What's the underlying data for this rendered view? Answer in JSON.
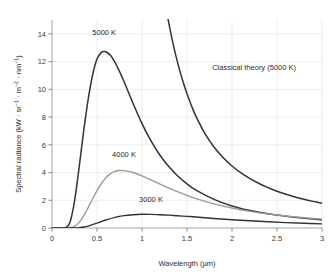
{
  "chart_data": {
    "type": "line",
    "title": "",
    "xlabel": "Wavelength (µm)",
    "ylabel_parts": {
      "base": "Spectral radiance (kW · sr",
      "sup1": "−1",
      "mid1": " · m",
      "sup2": "−2",
      "mid2": " · nm",
      "sup3": "−1",
      "close": ")"
    },
    "ylabel": "Spectral radiance (kW · sr−1 · m−2 · nm−1)",
    "xlim": [
      0,
      3
    ],
    "ylim": [
      0,
      15
    ],
    "xticks": [
      0,
      0.5,
      1,
      1.5,
      2,
      2.5,
      3
    ],
    "xticklabels": [
      "0",
      "0.5",
      "1",
      "1.5",
      "2",
      "2.5",
      "3"
    ],
    "yticks": [
      0,
      2,
      4,
      6,
      8,
      10,
      12,
      14
    ],
    "yticklabels": [
      "0",
      "2",
      "4",
      "6",
      "8",
      "10",
      "12",
      "14"
    ],
    "grid": true,
    "legend": "none",
    "annotations": [
      {
        "text": "5000 K",
        "x": 0.58,
        "y": 13.9,
        "name": "label-5000k"
      },
      {
        "text": "4000 K",
        "x": 0.8,
        "y": 5.1,
        "name": "label-4000k"
      },
      {
        "text": "3000 K",
        "x": 1.1,
        "y": 1.85,
        "name": "label-3000k"
      },
      {
        "text": "Classical theory (5000 K)",
        "x": 1.78,
        "y": 11.4,
        "name": "label-classical-theory"
      }
    ],
    "series": [
      {
        "name": "5000 K",
        "color": "#333333",
        "width": 1.5,
        "peak": {
          "x": 0.58,
          "y": 12.7
        },
        "x": [
          0.0,
          0.1,
          0.15,
          0.2,
          0.25,
          0.3,
          0.35,
          0.4,
          0.45,
          0.5,
          0.55,
          0.58,
          0.6,
          0.65,
          0.7,
          0.75,
          0.8,
          0.9,
          1.0,
          1.1,
          1.2,
          1.3,
          1.4,
          1.5,
          1.6,
          1.8,
          2.0,
          2.2,
          2.4,
          2.6,
          2.8,
          3.0
        ],
        "y": [
          0.0,
          0.0,
          0.03,
          0.42,
          1.92,
          4.3,
          6.9,
          9.21,
          11.0,
          12.19,
          12.67,
          12.72,
          12.7,
          12.45,
          11.95,
          11.3,
          10.56,
          9.0,
          7.53,
          6.28,
          5.25,
          4.41,
          3.73,
          3.18,
          2.73,
          2.06,
          1.59,
          1.26,
          1.02,
          0.84,
          0.7,
          0.59
        ]
      },
      {
        "name": "4000 K",
        "color": "#9a9a9a",
        "width": 1.4,
        "peak": {
          "x": 0.74,
          "y": 4.15
        },
        "x": [
          0.0,
          0.15,
          0.2,
          0.25,
          0.3,
          0.35,
          0.4,
          0.45,
          0.5,
          0.55,
          0.6,
          0.65,
          0.7,
          0.74,
          0.8,
          0.9,
          1.0,
          1.1,
          1.2,
          1.3,
          1.4,
          1.5,
          1.6,
          1.8,
          2.0,
          2.2,
          2.4,
          2.6,
          2.8,
          3.0
        ],
        "y": [
          0.0,
          0.0,
          0.02,
          0.12,
          0.39,
          0.85,
          1.45,
          2.09,
          2.7,
          3.22,
          3.63,
          3.92,
          4.09,
          4.15,
          4.14,
          4.0,
          3.76,
          3.47,
          3.17,
          2.88,
          2.6,
          2.35,
          2.12,
          1.74,
          1.44,
          1.2,
          1.01,
          0.86,
          0.74,
          0.64
        ]
      },
      {
        "name": "3000 K",
        "color": "#333333",
        "width": 1.4,
        "peak": {
          "x": 0.99,
          "y": 0.99
        },
        "x": [
          0.0,
          0.2,
          0.25,
          0.3,
          0.35,
          0.4,
          0.45,
          0.5,
          0.55,
          0.6,
          0.7,
          0.8,
          0.9,
          0.99,
          1.1,
          1.2,
          1.3,
          1.4,
          1.5,
          1.6,
          1.8,
          2.0,
          2.2,
          2.4,
          2.6,
          2.8,
          3.0
        ],
        "y": [
          0.0,
          0.0,
          0.01,
          0.03,
          0.07,
          0.14,
          0.24,
          0.35,
          0.47,
          0.58,
          0.77,
          0.89,
          0.96,
          0.99,
          0.98,
          0.96,
          0.93,
          0.88,
          0.84,
          0.79,
          0.69,
          0.6,
          0.52,
          0.45,
          0.39,
          0.34,
          0.3
        ]
      },
      {
        "name": "Classical theory (5000 K)",
        "color": "#333333",
        "width": 1.5,
        "x": [
          1.28,
          1.3,
          1.35,
          1.4,
          1.45,
          1.5,
          1.55,
          1.6,
          1.7,
          1.8,
          1.9,
          2.0,
          2.1,
          2.2,
          2.3,
          2.4,
          2.5,
          2.6,
          2.7,
          2.8,
          2.9,
          3.0
        ],
        "y": [
          15.4,
          14.7,
          13.15,
          11.82,
          10.67,
          9.68,
          8.81,
          8.05,
          6.8,
          5.84,
          5.08,
          4.47,
          3.97,
          3.56,
          3.21,
          2.91,
          2.65,
          2.43,
          2.24,
          2.07,
          1.92,
          1.78
        ]
      }
    ]
  }
}
